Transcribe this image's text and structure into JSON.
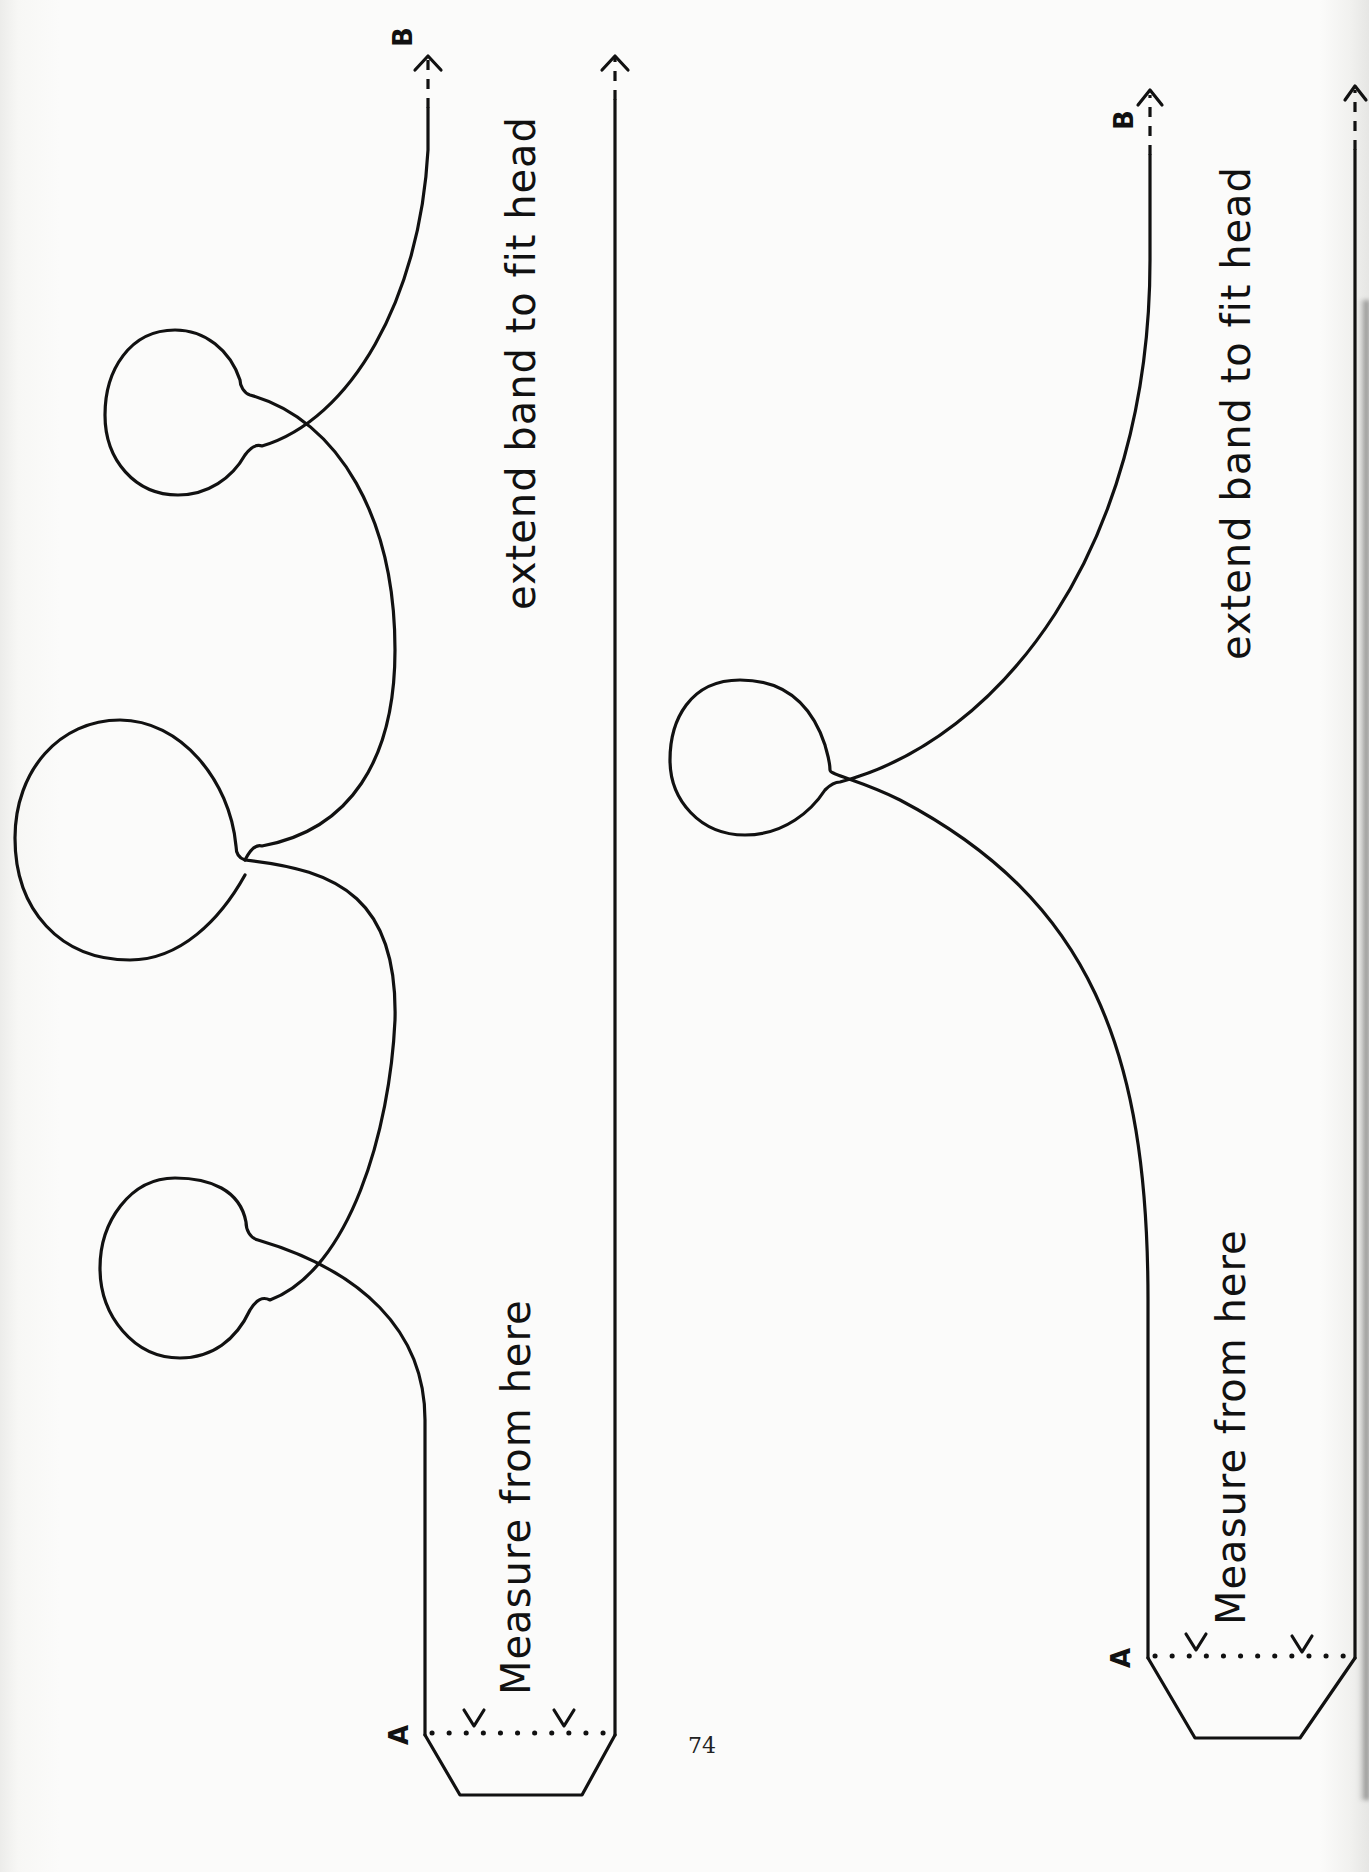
{
  "document": {
    "page_number": "74",
    "colors": {
      "ink": "#111111",
      "paper": "#fbfbfa"
    }
  },
  "pattern_left": {
    "name": "three-point crown band",
    "start_label": "A",
    "end_label": "B",
    "instruction_start": "Measure from here",
    "instruction_end": "extend band to fit head",
    "fold_marks": [
      "Y",
      "Y"
    ],
    "points": 3
  },
  "pattern_right": {
    "name": "single-point crown band",
    "start_label": "A",
    "end_label": "B",
    "instruction_start": "Measure from here",
    "instruction_end": "extend band to fit head",
    "fold_marks": [
      "Y",
      "Y"
    ],
    "points": 1
  }
}
